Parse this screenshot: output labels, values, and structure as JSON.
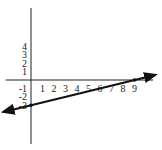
{
  "chart_data": {
    "type": "line",
    "title": "",
    "xlabel": "",
    "ylabel": "",
    "x_ticks": [
      "1",
      "2",
      "3",
      "4",
      "5",
      "6",
      "7",
      "8",
      "9"
    ],
    "y_ticks": [
      "4",
      "3",
      "2",
      "1",
      "-1",
      "-2",
      "-3"
    ],
    "x_tick_values": [
      1,
      2,
      3,
      4,
      5,
      6,
      7,
      8,
      9
    ],
    "y_tick_values": [
      4,
      3,
      2,
      1,
      -1,
      -2,
      -3
    ],
    "xlim": [
      -2.2,
      10
    ],
    "ylim": [
      -7.5,
      9
    ],
    "grid": false,
    "series": [
      {
        "name": "line",
        "description": "line through (0,-3) and (9,0), arrows at both ends",
        "points": [
          {
            "x": 0,
            "y": -3
          },
          {
            "x": 9,
            "y": 0
          }
        ],
        "slope": 0.3333,
        "intercept": -3
      }
    ],
    "marked_points": [
      {
        "x": 0,
        "y": -3
      },
      {
        "x": 9,
        "y": 0
      }
    ]
  }
}
